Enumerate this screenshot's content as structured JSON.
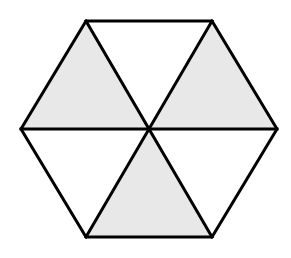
{
  "diagram": {
    "shape": "regular hexagon divided into 6 triangles",
    "total_parts": 6,
    "shaded_parts": 3,
    "colors": {
      "stroke": "#000000",
      "shaded_fill": "#e8e8e8",
      "unshaded_fill": "#ffffff",
      "background": "#ffffff"
    },
    "center": [
      149,
      129
    ],
    "vertices": {
      "top_left": [
        86,
        21
      ],
      "top_right": [
        212,
        21
      ],
      "right": [
        277,
        129
      ],
      "bottom_right": [
        212,
        237
      ],
      "bottom_left": [
        86,
        237
      ],
      "left": [
        21,
        129
      ]
    },
    "triangles": [
      {
        "name": "top-left",
        "points": "86,21 149,129 21,129",
        "shaded": true
      },
      {
        "name": "top",
        "points": "86,21 212,21 149,129",
        "shaded": false
      },
      {
        "name": "top-right",
        "points": "212,21 277,129 149,129",
        "shaded": true
      },
      {
        "name": "bottom-right",
        "points": "149,129 277,129 212,237",
        "shaded": false
      },
      {
        "name": "bottom",
        "points": "149,129 212,237 86,237",
        "shaded": true
      },
      {
        "name": "bottom-left",
        "points": "21,129 149,129 86,237",
        "shaded": false
      }
    ]
  }
}
